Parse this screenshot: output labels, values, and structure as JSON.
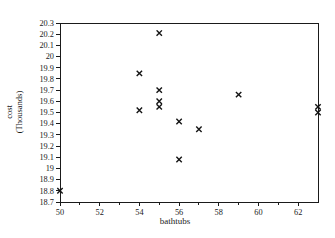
{
  "chart_data": {
    "type": "scatter",
    "title": "",
    "xlabel": "bathtubs",
    "ylabel": "cost (Thousands)",
    "ylabel_lines": [
      "cost",
      "(Thousands)"
    ],
    "xlim": [
      50,
      63
    ],
    "ylim": [
      18.7,
      20.3
    ],
    "grid": false,
    "legend": null,
    "marker": "x-cross",
    "marker_color": "#141414",
    "axis_color": "#1a1a1a",
    "text_color": "#1a1a1a",
    "background_color": "#ffffff",
    "x_ticks": [
      {
        "v": 50,
        "label": "50"
      },
      {
        "v": 52,
        "label": "52"
      },
      {
        "v": 54,
        "label": "54"
      },
      {
        "v": 56,
        "label": "56"
      },
      {
        "v": 58,
        "label": "58"
      },
      {
        "v": 60,
        "label": "60"
      },
      {
        "v": 62,
        "label": "62"
      }
    ],
    "x_minor_ticks": [
      51,
      53,
      55,
      57,
      59,
      61
    ],
    "y_ticks": [
      {
        "v": 20.3,
        "label": "20.3"
      },
      {
        "v": 20.2,
        "label": "20.2"
      },
      {
        "v": 20.1,
        "label": "20.1"
      },
      {
        "v": 20.0,
        "label": "20"
      },
      {
        "v": 19.9,
        "label": "19.9"
      },
      {
        "v": 19.8,
        "label": "19.8"
      },
      {
        "v": 19.7,
        "label": "19.7"
      },
      {
        "v": 19.6,
        "label": "19.6"
      },
      {
        "v": 19.5,
        "label": "19.5"
      },
      {
        "v": 19.4,
        "label": "19.4"
      },
      {
        "v": 19.3,
        "label": "19.3"
      },
      {
        "v": 19.2,
        "label": "19.2"
      },
      {
        "v": 19.1,
        "label": "19.1"
      },
      {
        "v": 19.0,
        "label": "19"
      },
      {
        "v": 18.9,
        "label": "18.9"
      },
      {
        "v": 18.8,
        "label": "18.8"
      },
      {
        "v": 18.7,
        "label": "18.7"
      }
    ],
    "points": [
      {
        "x": 50,
        "y": 18.8
      },
      {
        "x": 54,
        "y": 19.85
      },
      {
        "x": 54,
        "y": 19.52
      },
      {
        "x": 55,
        "y": 20.21
      },
      {
        "x": 55,
        "y": 19.7
      },
      {
        "x": 55,
        "y": 19.6
      },
      {
        "x": 55,
        "y": 19.55
      },
      {
        "x": 56,
        "y": 19.42
      },
      {
        "x": 56,
        "y": 19.08
      },
      {
        "x": 57,
        "y": 19.35
      },
      {
        "x": 59,
        "y": 19.66
      },
      {
        "x": 63,
        "y": 19.55
      },
      {
        "x": 63,
        "y": 19.5
      }
    ]
  }
}
